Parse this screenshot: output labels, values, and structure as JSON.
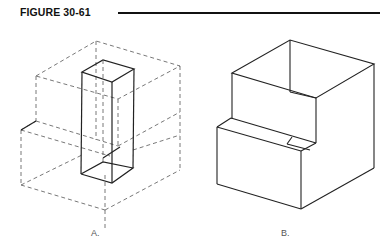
{
  "figure": {
    "title": "FIGURE 30-61",
    "labels": {
      "a": "A.",
      "b": "B."
    }
  },
  "colors": {
    "line": "#222222",
    "hidden_line": "#555555",
    "rule": "#111111"
  },
  "diagram": {
    "panel_a": {
      "description": "Rectangular prism inside dashed isometric bounding box",
      "dashed_box": true,
      "solid_prism": true
    },
    "panel_b": {
      "description": "Open-top box with stepped front (isometric)"
    }
  }
}
